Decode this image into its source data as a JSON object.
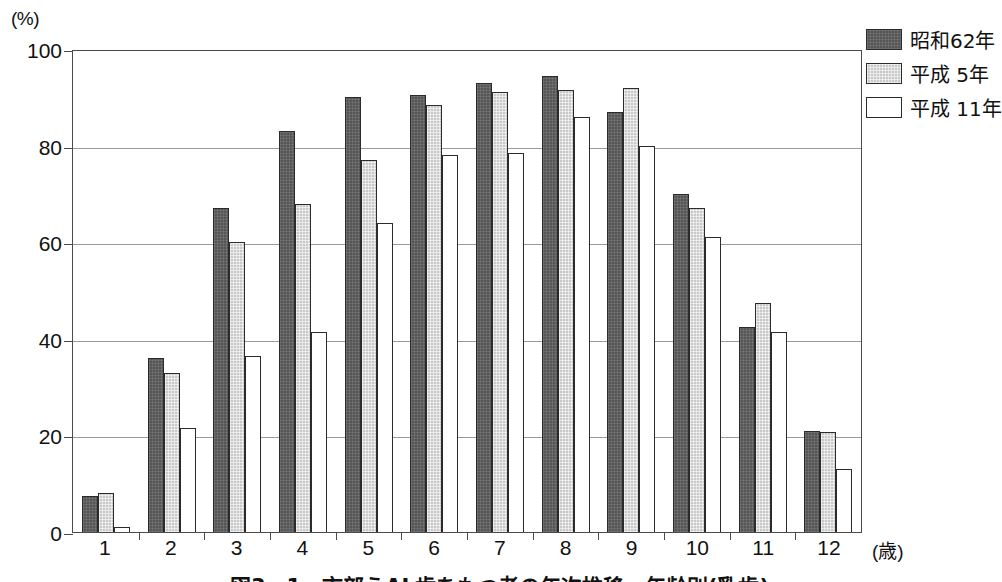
{
  "chart_data": {
    "type": "bar",
    "xlabel": "(歳)",
    "ylabel": "(%)",
    "ylim": [
      0,
      100
    ],
    "yticks": [
      0,
      20,
      40,
      60,
      80,
      100
    ],
    "grid": true,
    "legend_position": "top-right",
    "categories": [
      "1",
      "2",
      "3",
      "4",
      "5",
      "6",
      "7",
      "8",
      "9",
      "10",
      "11",
      "12"
    ],
    "series": [
      {
        "name": "昭和62年",
        "color": "#565656",
        "values": [
          7.5,
          36.0,
          67.0,
          83.0,
          90.0,
          90.5,
          93.0,
          94.5,
          87.0,
          70.0,
          42.5,
          21.0
        ]
      },
      {
        "name": "平成 5年",
        "color": "#c9c9c9",
        "values": [
          8.0,
          33.0,
          60.0,
          68.0,
          77.0,
          88.5,
          91.0,
          91.5,
          92.0,
          67.0,
          47.5,
          20.8
        ]
      },
      {
        "name": "平成 11年",
        "color": "#ffffff",
        "values": [
          1.0,
          21.5,
          36.5,
          41.5,
          64.0,
          78.0,
          78.5,
          86.0,
          80.0,
          61.0,
          41.5,
          13.0
        ]
      }
    ]
  },
  "axis": {
    "y_unit": "(%)",
    "x_unit": "(歳)",
    "ytick_labels": [
      "100",
      "80",
      "60",
      "40",
      "20",
      "0"
    ]
  },
  "legend": {
    "items": [
      {
        "label": "昭和62年"
      },
      {
        "label": "平成 5年"
      },
      {
        "label": "平成 11年"
      }
    ]
  },
  "caption": {
    "text": "図3－1　市部うAL歯をもつ者の年次推移、年齢別(乳歯)"
  }
}
